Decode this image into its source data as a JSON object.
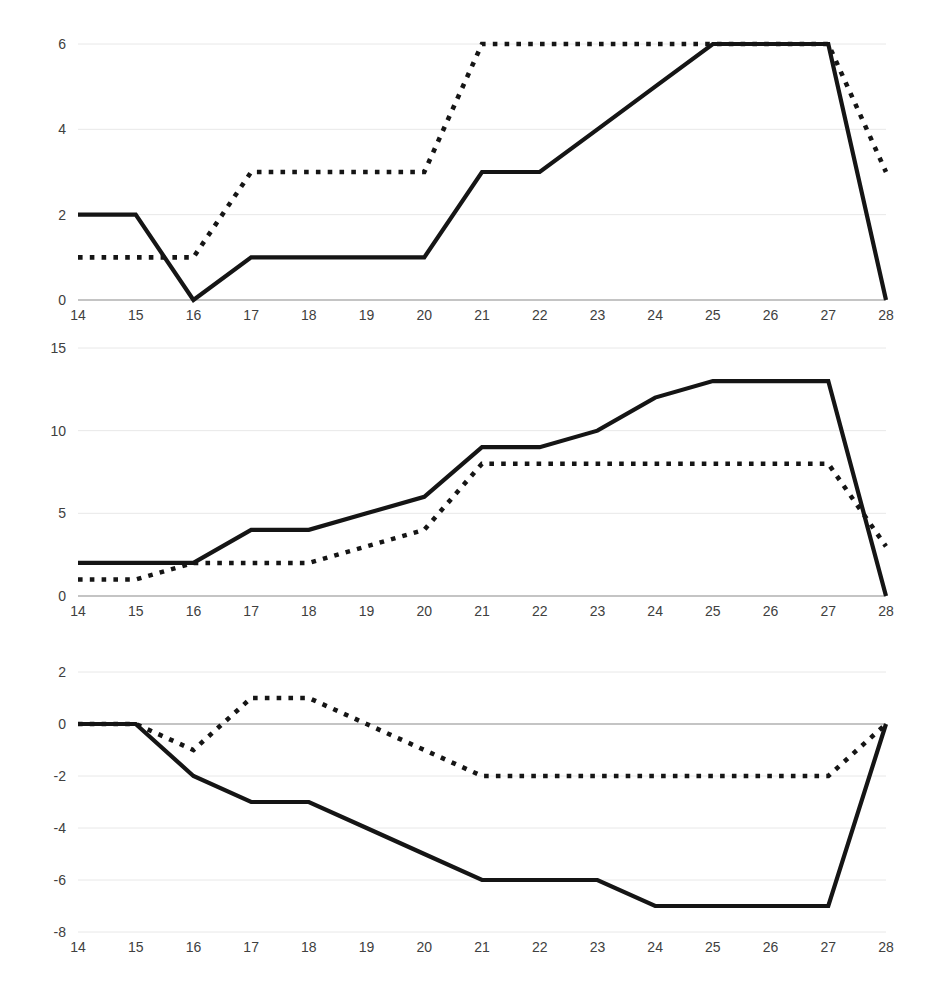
{
  "page": {
    "background": "#ffffff",
    "line_color": "#151515",
    "grid_color": "#e8e8e8",
    "axis_color": "#8a8a8a",
    "tick_text_color": "#404040"
  },
  "chart_data": [
    {
      "type": "line",
      "title": "",
      "xlabel": "",
      "ylabel": "",
      "grid": true,
      "legend": "none",
      "x": [
        14,
        15,
        16,
        17,
        18,
        19,
        20,
        21,
        22,
        23,
        24,
        25,
        26,
        27,
        28
      ],
      "xtick_labels": [
        "14",
        "15",
        "16",
        "17",
        "18",
        "19",
        "20",
        "21",
        "22",
        "23",
        "24",
        "25",
        "26",
        "27",
        "28"
      ],
      "ytick_labels": [
        "0",
        "2",
        "4",
        "6"
      ],
      "yticks": [
        0,
        2,
        4,
        6
      ],
      "ylim": [
        0,
        6
      ],
      "xlim": [
        14,
        28
      ],
      "series": [
        {
          "name": "solid",
          "style": "solid",
          "values": [
            2,
            2,
            0,
            1,
            1,
            1,
            1,
            3,
            3,
            4,
            5,
            6,
            6,
            6,
            0
          ]
        },
        {
          "name": "dotted",
          "style": "dotted",
          "values": [
            1,
            1,
            1,
            3,
            3,
            3,
            3,
            6,
            6,
            6,
            6,
            6,
            6,
            6,
            3
          ]
        }
      ]
    },
    {
      "type": "line",
      "title": "",
      "xlabel": "",
      "ylabel": "",
      "grid": true,
      "legend": "none",
      "x": [
        14,
        15,
        16,
        17,
        18,
        19,
        20,
        21,
        22,
        23,
        24,
        25,
        26,
        27,
        28
      ],
      "xtick_labels": [
        "14",
        "15",
        "16",
        "17",
        "18",
        "19",
        "20",
        "21",
        "22",
        "23",
        "24",
        "25",
        "26",
        "27",
        "28"
      ],
      "ytick_labels": [
        "0",
        "5",
        "10",
        "15"
      ],
      "yticks": [
        0,
        5,
        10,
        15
      ],
      "ylim": [
        0,
        15
      ],
      "xlim": [
        14,
        28
      ],
      "series": [
        {
          "name": "solid",
          "style": "solid",
          "values": [
            2,
            2,
            2,
            4,
            4,
            5,
            6,
            9,
            9,
            10,
            12,
            13,
            13,
            13,
            0
          ]
        },
        {
          "name": "dotted",
          "style": "dotted",
          "values": [
            1,
            1,
            2,
            2,
            2,
            3,
            4,
            8,
            8,
            8,
            8,
            8,
            8,
            8,
            3
          ]
        }
      ]
    },
    {
      "type": "line",
      "title": "",
      "xlabel": "",
      "ylabel": "",
      "grid": true,
      "legend": "none",
      "x": [
        14,
        15,
        16,
        17,
        18,
        19,
        20,
        21,
        22,
        23,
        24,
        25,
        26,
        27,
        28
      ],
      "xtick_labels": [
        "14",
        "15",
        "16",
        "17",
        "18",
        "19",
        "20",
        "21",
        "22",
        "23",
        "24",
        "25",
        "26",
        "27",
        "28"
      ],
      "ytick_labels": [
        "-8",
        "-6",
        "-4",
        "-2",
        "0",
        "2"
      ],
      "yticks": [
        -8,
        -6,
        -4,
        -2,
        0,
        2
      ],
      "ylim": [
        -8,
        2
      ],
      "xlim": [
        14,
        28
      ],
      "series": [
        {
          "name": "solid",
          "style": "solid",
          "values": [
            0,
            0,
            -2,
            -3,
            -3,
            -4,
            -5,
            -6,
            -6,
            -6,
            -7,
            -7,
            -7,
            -7,
            0
          ]
        },
        {
          "name": "dotted",
          "style": "dotted",
          "values": [
            0,
            0,
            -1,
            1,
            1,
            0,
            -1,
            -2,
            -2,
            -2,
            -2,
            -2,
            -2,
            -2,
            0
          ]
        }
      ]
    }
  ]
}
